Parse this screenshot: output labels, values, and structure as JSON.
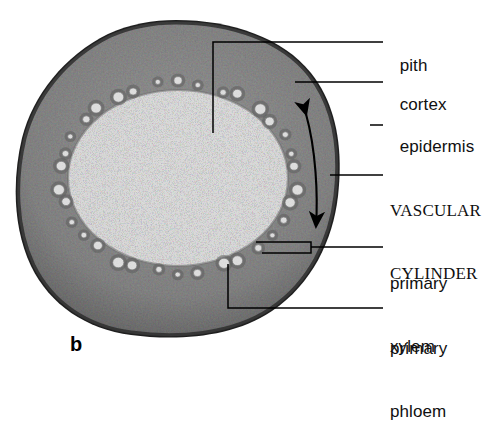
{
  "figure": {
    "panel_letter": "b",
    "specimen": "plant stem cross section (herbaceous dicot)",
    "regions": [
      {
        "id": "pith",
        "tone": "#c8c8c8",
        "note": "light central parenchyma"
      },
      {
        "id": "vascular-cylinder",
        "tone": "#b0b0b0",
        "note": "ring of vascular bundles"
      },
      {
        "id": "cortex",
        "tone": "#9a9a9a",
        "note": "dark speckled outer ground tissue"
      },
      {
        "id": "epidermis",
        "tone": "#4a4a4a",
        "note": "dark outermost cell layer"
      }
    ]
  },
  "labels": [
    {
      "id": "pith",
      "text": "pith",
      "style": "sans",
      "x": 390,
      "y": 34,
      "leader": "elbow-down",
      "leader_path": "M 213 133 L 213 42 L 383 42"
    },
    {
      "id": "cortex",
      "text": "cortex",
      "style": "sans",
      "x": 390,
      "y": 73,
      "leader": "straight",
      "leader_path": "M 295 82 L 383 82"
    },
    {
      "id": "epidermis",
      "text": "epidermis",
      "style": "sans",
      "x": 390,
      "y": 115,
      "leader": "straight",
      "leader_path": "M 370 125 L 383 125"
    },
    {
      "id": "vascular-cylinder",
      "text": "VASCULAR",
      "text2": "CYLINDER",
      "style": "serif",
      "x": 390,
      "y": 158,
      "leader": "straight",
      "leader_path": "M 330 175 L 383 175"
    },
    {
      "id": "primary-xylem",
      "text": "primary",
      "text2": "xylem",
      "style": "sans",
      "x": 390,
      "y": 231,
      "leader": "bracket",
      "leader_path": "M 256 242 L 311 242 L 311 253 L 262 253 M 311 247 L 383 247"
    },
    {
      "id": "primary-phloem",
      "text": "primary",
      "text2": "phloem",
      "style": "sans",
      "x": 390,
      "y": 296,
      "leader": "elbow-up",
      "leader_path": "M 228 264 L 228 308 L 383 308"
    }
  ],
  "annotations": [
    {
      "id": "cortex-extent-arrow",
      "kind": "double-headed-curved-arrow",
      "note": "spans the cortex thickness",
      "path": "M 306 114 C 316 150, 318 195, 316 226"
    }
  ],
  "colors": {
    "ink": "#000000",
    "label_text": "#101010",
    "background": "#ffffff",
    "pith": "#c9c9c9",
    "cortex": "#8f8f8f",
    "epidermis": "#3d3d3d",
    "bundle": "#e0e0e0"
  },
  "vascular_bundles": {
    "count": 34,
    "note": "light circular bundles arranged in an oval ring",
    "ring": {
      "cx": 178,
      "cy": 178,
      "rx": 118,
      "ry": 95
    }
  }
}
